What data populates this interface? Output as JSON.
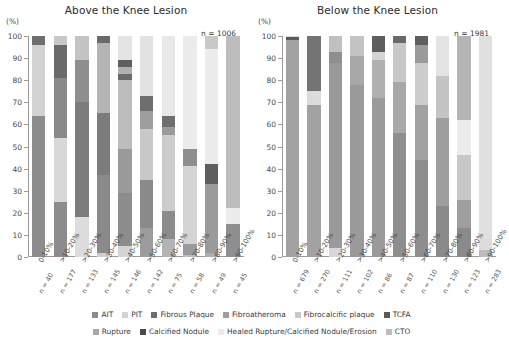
{
  "chart_data": {
    "type": "bar",
    "subtype": "stacked-percentage",
    "ylabel": "(%)",
    "ylim": [
      0,
      100
    ],
    "yticks": [
      0,
      10,
      20,
      30,
      40,
      50,
      60,
      70,
      80,
      90,
      100
    ],
    "grid": false,
    "legend_position": "bottom",
    "categories": [
      "0-10%",
      ">10-20%",
      ">20-30%",
      ">30-40%",
      ">40-50%",
      ">50-60%",
      ">60-70%",
      ">70-80%",
      ">80-90%",
      ">90-100%"
    ],
    "series_names": [
      "AIT",
      "PIT",
      "Fibrous Plaque",
      "Fibroatheroma",
      "Fibrocalcific plaque",
      "TCFA",
      "Rupture",
      "Calcified Nodule",
      "Healed Rupture/Calcified Nodule/Erosion",
      "CTO"
    ],
    "series_colors": [
      "#8c8c8c",
      "#d2d2d2",
      "#6e6e6e",
      "#9e9e9e",
      "#c8c8c8",
      "#5a5a5a",
      "#a8a8a8",
      "#4a4a4a",
      "#ececec",
      "#bdbdbd"
    ],
    "panels": [
      {
        "name": "above-knee",
        "title": "Above the Knee Lesion",
        "n_total_label": "n = 1006",
        "n_total": 1006,
        "group_n": [
          40,
          177,
          133,
          145,
          146,
          142,
          75,
          58,
          49,
          45
        ],
        "group_n_labels": [
          "n = 40",
          "n = 177",
          "n = 133",
          "n = 145",
          "n = 146",
          "n = 142",
          "n = 75",
          "n = 58",
          "n = 49",
          "n = 45"
        ],
        "series": [
          {
            "name": "AIT",
            "values": [
              0,
              0,
              0,
              0,
              0,
              0,
              0,
              0,
              0,
              0
            ]
          },
          {
            "name": "PIT",
            "values": [
              0,
              0,
              0,
              0,
              0,
              0,
              0,
              0,
              0,
              0
            ]
          },
          {
            "name": "Fibrous Plaque",
            "values": [
              64,
              25,
              19,
              37,
              29,
              13,
              8,
              1,
              0,
              0
            ]
          },
          {
            "name": "Fibroatheroma",
            "values": [
              0,
              29,
              51,
              28,
              20,
              22,
              13,
              5,
              2,
              0
            ]
          },
          {
            "name": "Fibrocalcific plaque",
            "values": [
              32,
              28,
              19,
              32,
              0,
              0,
              0,
              0,
              0,
              0
            ]
          },
          {
            "name": "TCFA",
            "values": [
              4,
              14,
              11,
              1,
              0,
              0,
              0,
              0,
              0,
              0
            ]
          },
          {
            "name": "Rupture",
            "values": [
              0,
              0,
              0,
              0,
              0,
              21,
              34,
              35,
              31,
              15
            ]
          },
          {
            "name": "Calcified Nodule",
            "values": [
              0,
              4,
              0,
              0,
              5,
              3,
              0,
              0,
              0,
              0
            ]
          },
          {
            "name": "Healed Rupture/Calcified Nodule/Erosion",
            "values": [
              0,
              0,
              0,
              2,
              34,
              41,
              39,
              52,
              61,
              0
            ]
          },
          {
            "name": "CTO",
            "values": [
              0,
              0,
              0,
              0,
              12,
              0,
              6,
              7,
              6,
              85
            ]
          }
        ],
        "stack_segments": [
          [
            {
              "s": 0,
              "e": 64,
              "c": "#8c8c8c"
            },
            {
              "s": 64,
              "e": 96,
              "c": "#d2d2d2"
            },
            {
              "s": 96,
              "e": 100,
              "c": "#6e6e6e"
            }
          ],
          [
            {
              "s": 0,
              "e": 25,
              "c": "#8c8c8c"
            },
            {
              "s": 25,
              "e": 54,
              "c": "#d8d8d8"
            },
            {
              "s": 54,
              "e": 81,
              "c": "#8a8a8a"
            },
            {
              "s": 81,
              "e": 96,
              "c": "#6a6a6a"
            },
            {
              "s": 96,
              "e": 100,
              "c": "#c8c8c8"
            }
          ],
          [
            {
              "s": 0,
              "e": 18,
              "c": "#dcdcdc"
            },
            {
              "s": 18,
              "e": 70,
              "c": "#7c7c7c"
            },
            {
              "s": 70,
              "e": 89,
              "c": "#8e8e8e"
            },
            {
              "s": 89,
              "e": 100,
              "c": "#c4c4c4"
            }
          ],
          [
            {
              "s": 0,
              "e": 2,
              "c": "#cfcfcf"
            },
            {
              "s": 2,
              "e": 37,
              "c": "#8a8a8a"
            },
            {
              "s": 37,
              "e": 65,
              "c": "#7c7c7c"
            },
            {
              "s": 65,
              "e": 97,
              "c": "#b4b4b4"
            },
            {
              "s": 97,
              "e": 100,
              "c": "#6a6a6a"
            }
          ],
          [
            {
              "s": 0,
              "e": 5,
              "c": "#d4d4d4"
            },
            {
              "s": 5,
              "e": 29,
              "c": "#8c8c8c"
            },
            {
              "s": 29,
              "e": 49,
              "c": "#9a9a9a"
            },
            {
              "s": 49,
              "e": 80,
              "c": "#bdbdbd"
            },
            {
              "s": 80,
              "e": 83,
              "c": "#6a6a6a"
            },
            {
              "s": 83,
              "e": 86,
              "c": "#b0b0b0"
            },
            {
              "s": 86,
              "e": 89,
              "c": "#5e5e5e"
            },
            {
              "s": 89,
              "e": 100,
              "c": "#e4e4e4"
            }
          ],
          [
            {
              "s": 0,
              "e": 13,
              "c": "#9c9c9c"
            },
            {
              "s": 13,
              "e": 35,
              "c": "#8a8a8a"
            },
            {
              "s": 35,
              "e": 58,
              "c": "#c8c8c8"
            },
            {
              "s": 58,
              "e": 66,
              "c": "#9e9e9e"
            },
            {
              "s": 66,
              "e": 73,
              "c": "#6e6e6e"
            },
            {
              "s": 73,
              "e": 100,
              "c": "#e2e2e2"
            }
          ],
          [
            {
              "s": 0,
              "e": 8,
              "c": "#b4b4b4"
            },
            {
              "s": 8,
              "e": 21,
              "c": "#8c8c8c"
            },
            {
              "s": 21,
              "e": 55,
              "c": "#cccccc"
            },
            {
              "s": 55,
              "e": 59,
              "c": "#9a9a9a"
            },
            {
              "s": 59,
              "e": 64,
              "c": "#6e6e6e"
            },
            {
              "s": 64,
              "e": 100,
              "c": "#e8e8e8"
            }
          ],
          [
            {
              "s": 0,
              "e": 1,
              "c": "#bdbdbd"
            },
            {
              "s": 1,
              "e": 6,
              "c": "#9a9a9a"
            },
            {
              "s": 6,
              "e": 41,
              "c": "#d4d4d4"
            },
            {
              "s": 41,
              "e": 49,
              "c": "#8e8e8e"
            },
            {
              "s": 49,
              "e": 100,
              "c": "#ececec"
            }
          ],
          [
            {
              "s": 0,
              "e": 2,
              "c": "#aeaeae"
            },
            {
              "s": 2,
              "e": 33,
              "c": "#9a9a9a"
            },
            {
              "s": 33,
              "e": 42,
              "c": "#5e5e5e"
            },
            {
              "s": 42,
              "e": 94,
              "c": "#ececec"
            },
            {
              "s": 94,
              "e": 100,
              "c": "#c8c8c8"
            }
          ],
          [
            {
              "s": 0,
              "e": 15,
              "c": "#8e8e8e"
            },
            {
              "s": 15,
              "e": 22,
              "c": "#ececec"
            },
            {
              "s": 22,
              "e": 100,
              "c": "#bdbdbd"
            }
          ]
        ]
      },
      {
        "name": "below-knee",
        "title": "Below the Knee Lesion",
        "n_total_label": "n = 1981",
        "n_total": 1981,
        "group_n": [
          679,
          270,
          111,
          102,
          86,
          87,
          110,
          130,
          123,
          283
        ],
        "group_n_labels": [
          "n = 679",
          "n = 270",
          "n = 111",
          "n = 102",
          "n = 86",
          "n = 87",
          "n = 110",
          "n = 130",
          "n = 123",
          "n = 283"
        ],
        "series": [
          {
            "name": "AIT",
            "values": [
              0,
              0,
              0,
              0,
              0,
              0,
              0,
              0,
              0,
              0
            ]
          },
          {
            "name": "PIT",
            "values": [
              0,
              0,
              0,
              0,
              0,
              0,
              0,
              0,
              0,
              0
            ]
          },
          {
            "name": "Fibrous Plaque",
            "values": [
              98,
              69,
              88,
              78,
              72,
              56,
              44,
              23,
              13,
              3
            ]
          },
          {
            "name": "Fibroatheroma",
            "values": [
              0,
              0,
              5,
              13,
              17,
              23,
              25,
              21,
              13,
              0
            ]
          },
          {
            "name": "Fibrocalcific plaque",
            "values": [
              0,
              6,
              0,
              0,
              0,
              0,
              12,
              25,
              24,
              0
            ]
          },
          {
            "name": "TCFA",
            "values": [
              1.5,
              25,
              0,
              0,
              7,
              0,
              0,
              0,
              0,
              0
            ]
          },
          {
            "name": "Rupture",
            "values": [
              0,
              0,
              0,
              0,
              0,
              0,
              0,
              0,
              0,
              0
            ]
          },
          {
            "name": "Calcified Nodule",
            "values": [
              0,
              0,
              0,
              0,
              0,
              0,
              0,
              0,
              0,
              0
            ]
          },
          {
            "name": "Healed Rupture/Calcified Nodule/Erosion",
            "values": [
              0,
              0,
              7,
              9,
              4,
              21,
              19,
              31,
              50,
              5
            ]
          },
          {
            "name": "CTO",
            "values": [
              0,
              0,
              0,
              0,
              0,
              0,
              0,
              0,
              0,
              92
            ]
          }
        ],
        "stack_segments": [
          [
            {
              "s": 0,
              "e": 98,
              "c": "#a2a2a2"
            },
            {
              "s": 98,
              "e": 99.5,
              "c": "#5a5a5a"
            },
            {
              "s": 99.5,
              "e": 100,
              "c": "#d8d8d8"
            }
          ],
          [
            {
              "s": 0,
              "e": 69,
              "c": "#a2a2a2"
            },
            {
              "s": 69,
              "e": 75,
              "c": "#dcdcdc"
            },
            {
              "s": 75,
              "e": 100,
              "c": "#747474"
            }
          ],
          [
            {
              "s": 0,
              "e": 4,
              "c": "#d8d8d8"
            },
            {
              "s": 4,
              "e": 88,
              "c": "#9a9a9a"
            },
            {
              "s": 88,
              "e": 93,
              "c": "#8e8e8e"
            },
            {
              "s": 93,
              "e": 100,
              "c": "#c0c0c0"
            }
          ],
          [
            {
              "s": 0,
              "e": 78,
              "c": "#9a9a9a"
            },
            {
              "s": 78,
              "e": 91,
              "c": "#a8a8a8"
            },
            {
              "s": 91,
              "e": 100,
              "c": "#c4c4c4"
            }
          ],
          [
            {
              "s": 0,
              "e": 72,
              "c": "#9a9a9a"
            },
            {
              "s": 72,
              "e": 89,
              "c": "#b0b0b0"
            },
            {
              "s": 89,
              "e": 93,
              "c": "#d4d4d4"
            },
            {
              "s": 93,
              "e": 100,
              "c": "#5e5e5e"
            }
          ],
          [
            {
              "s": 0,
              "e": 56,
              "c": "#8e8e8e"
            },
            {
              "s": 56,
              "e": 79,
              "c": "#a8a8a8"
            },
            {
              "s": 79,
              "e": 97,
              "c": "#c8c8c8"
            },
            {
              "s": 97,
              "e": 100,
              "c": "#6a6a6a"
            }
          ],
          [
            {
              "s": 0,
              "e": 44,
              "c": "#8e8e8e"
            },
            {
              "s": 44,
              "e": 69,
              "c": "#a2a2a2"
            },
            {
              "s": 69,
              "e": 88,
              "c": "#cccccc"
            },
            {
              "s": 88,
              "e": 96,
              "c": "#9a9a9a"
            },
            {
              "s": 96,
              "e": 100,
              "c": "#5e5e5e"
            }
          ],
          [
            {
              "s": 0,
              "e": 23,
              "c": "#8a8a8a"
            },
            {
              "s": 23,
              "e": 63,
              "c": "#9e9e9e"
            },
            {
              "s": 63,
              "e": 82,
              "c": "#c4c4c4"
            },
            {
              "s": 82,
              "e": 100,
              "c": "#e4e4e4"
            }
          ],
          [
            {
              "s": 0,
              "e": 13,
              "c": "#8a8a8a"
            },
            {
              "s": 13,
              "e": 26,
              "c": "#9e9e9e"
            },
            {
              "s": 26,
              "e": 46,
              "c": "#c8c8c8"
            },
            {
              "s": 46,
              "e": 62,
              "c": "#ececec"
            },
            {
              "s": 62,
              "e": 100,
              "c": "#b4b4b4"
            }
          ],
          [
            {
              "s": 0,
              "e": 3,
              "c": "#bdbdbd"
            },
            {
              "s": 3,
              "e": 8,
              "c": "#dcdcdc"
            },
            {
              "s": 8,
              "e": 100,
              "c": "#e0e0e0"
            }
          ]
        ]
      }
    ],
    "legend": [
      {
        "label": "AIT",
        "color": "#8c8c8c"
      },
      {
        "label": "PIT",
        "color": "#d2d2d2"
      },
      {
        "label": "Fibrous Plaque",
        "color": "#6e6e6e"
      },
      {
        "label": "Fibroatheroma",
        "color": "#9e9e9e"
      },
      {
        "label": "Fibrocalcific plaque",
        "color": "#c8c8c8"
      },
      {
        "label": "TCFA",
        "color": "#5a5a5a"
      },
      {
        "label": "Rupture",
        "color": "#a8a8a8"
      },
      {
        "label": "Calcified Nodule",
        "color": "#4a4a4a"
      },
      {
        "label": "Healed Rupture/Calcified Nodule/Erosion",
        "color": "#ececec"
      },
      {
        "label": "CTO",
        "color": "#bdbdbd"
      }
    ]
  }
}
